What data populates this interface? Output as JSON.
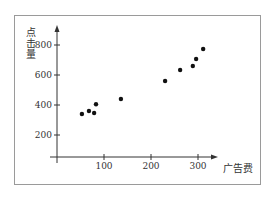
{
  "chart_data": {
    "type": "scatter",
    "title": "",
    "xlabel": "广告费",
    "ylabel": "点击量",
    "xlim": [
      0,
      330
    ],
    "ylim": [
      100,
      900
    ],
    "x_ticks": [
      100,
      200,
      300
    ],
    "y_ticks": [
      200,
      400,
      600,
      800
    ],
    "grid": false,
    "legend": null,
    "points": [
      {
        "x": 53,
        "y": 340
      },
      {
        "x": 68,
        "y": 360
      },
      {
        "x": 79,
        "y": 347
      },
      {
        "x": 83,
        "y": 405
      },
      {
        "x": 136,
        "y": 440
      },
      {
        "x": 230,
        "y": 560
      },
      {
        "x": 262,
        "y": 633
      },
      {
        "x": 289,
        "y": 660
      },
      {
        "x": 296,
        "y": 707
      },
      {
        "x": 311,
        "y": 773
      }
    ]
  },
  "colors": {
    "frame": "#9a9a9a",
    "axis": "#333333",
    "point": "#111111"
  }
}
